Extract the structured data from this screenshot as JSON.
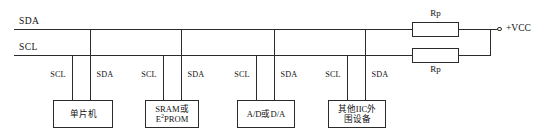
{
  "diagram": {
    "bus_lines": [
      {
        "name": "SDA",
        "label": "SDA"
      },
      {
        "name": "SCL",
        "label": "SCL"
      }
    ],
    "supply": {
      "label": "+VCC",
      "terminal_icon": "open-circle-terminal"
    },
    "pullup_resistors": [
      {
        "label": "Rp",
        "attached_bus": "SDA",
        "label_position": "above"
      },
      {
        "label": "Rp",
        "attached_bus": "SCL",
        "label_position": "below"
      }
    ],
    "devices": [
      {
        "name": "mcu",
        "lines": [
          "单片机"
        ],
        "pins": [
          {
            "label": "SCL",
            "bus": "SCL"
          },
          {
            "label": "SDA",
            "bus": "SDA"
          }
        ]
      },
      {
        "name": "memory",
        "lines": [
          "SRAM或",
          "E2PROM"
        ],
        "line1": "SRAM或",
        "line2_pre": "E",
        "line2_sup": "2",
        "line2_post": "PROM",
        "pins": [
          {
            "label": "SCL",
            "bus": "SCL"
          },
          {
            "label": "SDA",
            "bus": "SDA"
          }
        ]
      },
      {
        "name": "converter",
        "lines": [
          "A/D或D/A"
        ],
        "pins": [
          {
            "label": "SCL",
            "bus": "SCL"
          },
          {
            "label": "SDA",
            "bus": "SDA"
          }
        ]
      },
      {
        "name": "other-peripheral",
        "lines": [
          "其他IIC外",
          "围设备"
        ],
        "pins": [
          {
            "label": "SCL",
            "bus": "SCL"
          },
          {
            "label": "SDA",
            "bus": "SDA"
          }
        ]
      }
    ],
    "colors": {
      "wire": "#2b2b2b",
      "text": "#111111",
      "background": "#ffffff"
    }
  }
}
